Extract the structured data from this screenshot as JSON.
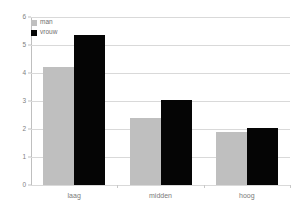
{
  "chart_data": {
    "type": "bar",
    "title": "",
    "subtitle": "",
    "xlabel": "",
    "ylabel": "",
    "categories": [
      "laag",
      "midden",
      "hoog"
    ],
    "series": [
      {
        "name": "man",
        "color": "#bfbfbf",
        "values": [
          4.2,
          2.4,
          1.9
        ]
      },
      {
        "name": "vrouw",
        "color": "#050505",
        "values": [
          5.35,
          3.05,
          2.05
        ]
      }
    ],
    "ylim": [
      0,
      6
    ],
    "yticks": [
      0,
      1,
      2,
      3,
      4,
      5,
      6
    ],
    "ytick_labels": [
      "0",
      "1",
      "2",
      "3",
      "4",
      "5",
      "6"
    ],
    "grid": true,
    "grid_axis": "y",
    "legend_position": "top-left",
    "background": "#ffffff",
    "gridline_color": "#d9d9d9",
    "axis_color": "#bfbfbf",
    "tick_label_color": "#808080"
  },
  "legend": {
    "entries": [
      {
        "label": "man"
      },
      {
        "label": "vrouw"
      }
    ]
  }
}
